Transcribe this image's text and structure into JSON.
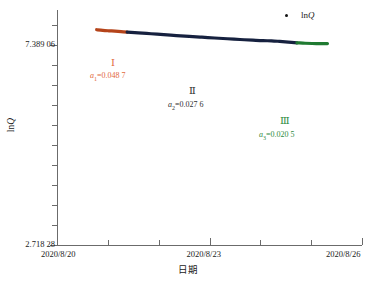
{
  "chart_data": {
    "type": "line",
    "title": "",
    "xlabel": "日期",
    "ylabel": "lnQ",
    "ylabel_parts": {
      "prefix": "ln",
      "italic": "Q"
    },
    "legend": [
      {
        "name": "lnQ",
        "prefix": "ln",
        "italic": "Q",
        "marker": "dot",
        "color": "#141414"
      }
    ],
    "legend_position": "top-right",
    "grid": false,
    "x_ticks": [
      {
        "label": "2020/8/20",
        "value": 0,
        "major": true
      },
      {
        "label": "",
        "value": 1,
        "major": false
      },
      {
        "label": "",
        "value": 2,
        "major": false
      },
      {
        "label": "2020/8/23",
        "value": 3,
        "major": true
      },
      {
        "label": "",
        "value": 4,
        "major": false
      },
      {
        "label": "",
        "value": 5,
        "major": false
      },
      {
        "label": "2020/8/26",
        "value": 6,
        "major": true
      }
    ],
    "xlim": [
      0,
      6
    ],
    "y_ticks": [
      {
        "label": "7.389 06",
        "value": 7.38906,
        "major": true
      },
      {
        "label": "2.718 28",
        "value": 2.71828,
        "major": true
      }
    ],
    "y_minor_count": 10,
    "ylim": [
      2.71828,
      8.2
    ],
    "series": [
      {
        "name": "lnQ",
        "segments": [
          {
            "id": "I",
            "color": "#b5441a",
            "slope_label": "a₁=0.048 7",
            "slope_symbol": "a",
            "slope_subscript": "1",
            "slope_value": 0.0487,
            "points": [
              [
                0.78,
                7.74
              ],
              [
                0.9,
                7.725
              ],
              [
                1.02,
                7.715
              ],
              [
                1.14,
                7.706
              ],
              [
                1.26,
                7.695
              ],
              [
                1.38,
                7.685
              ]
            ]
          },
          {
            "id": "II",
            "color": "#16213f",
            "slope_label": "a₂=0.027 6",
            "slope_symbol": "a",
            "slope_subscript": "2",
            "slope_value": 0.0276,
            "points": [
              [
                1.38,
                7.685
              ],
              [
                1.6,
                7.666
              ],
              [
                1.85,
                7.646
              ],
              [
                2.1,
                7.625
              ],
              [
                2.35,
                7.604
              ],
              [
                2.6,
                7.586
              ],
              [
                2.85,
                7.566
              ],
              [
                3.1,
                7.547
              ],
              [
                3.35,
                7.529
              ],
              [
                3.6,
                7.512
              ],
              [
                3.85,
                7.496
              ],
              [
                4.05,
                7.484
              ],
              [
                4.22,
                7.481
              ],
              [
                4.38,
                7.468
              ],
              [
                4.55,
                7.452
              ],
              [
                4.72,
                7.435
              ]
            ]
          },
          {
            "id": "III",
            "color": "#1f7a31",
            "slope_label": "a₃=0.020 5",
            "slope_symbol": "a",
            "slope_subscript": "3",
            "slope_value": 0.0205,
            "points": [
              [
                4.72,
                7.435
              ],
              [
                4.88,
                7.424
              ],
              [
                5.02,
                7.419
              ],
              [
                5.18,
                7.417
              ],
              [
                5.32,
                7.417
              ]
            ]
          }
        ]
      }
    ],
    "annotations": [
      {
        "id": "seg1-roman",
        "text": "Ⅰ",
        "color": "#e2683c"
      },
      {
        "id": "seg1-eq",
        "text": "a1=0.048 7",
        "color": "#e2683c"
      },
      {
        "id": "seg2-roman",
        "text": "Ⅱ",
        "color": "#303030"
      },
      {
        "id": "seg2-eq",
        "text": "a2=0.027 6",
        "color": "#303030"
      },
      {
        "id": "seg3-roman",
        "text": "Ⅲ",
        "color": "#2e8b40"
      },
      {
        "id": "seg3-eq",
        "text": "a3=0.020 5",
        "color": "#2e8b40"
      }
    ]
  }
}
